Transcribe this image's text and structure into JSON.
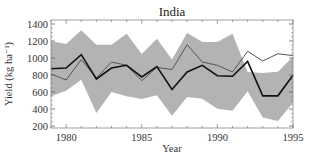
{
  "chart_data": {
    "type": "line",
    "title": "India",
    "xlabel": "Year",
    "ylabel": "Yield (kg ha⁻¹)",
    "xlim": [
      1979,
      1995
    ],
    "ylim": [
      150,
      1450
    ],
    "x_ticks": [
      1980,
      1985,
      1990,
      1995
    ],
    "y_ticks": [
      200,
      400,
      600,
      800,
      1000,
      1200,
      1400
    ],
    "grid": false,
    "legend": null,
    "x": [
      1979,
      1980,
      1981,
      1982,
      1983,
      1984,
      1985,
      1986,
      1987,
      1988,
      1989,
      1990,
      1991,
      1992,
      1993,
      1994,
      1995
    ],
    "series": [
      {
        "name": "observed",
        "style": "thick-black-line",
        "color": "#111111",
        "values": [
          874,
          882,
          1039,
          753,
          882,
          914,
          777,
          898,
          630,
          835,
          914,
          792,
          785,
          961,
          555,
          555,
          798
        ]
      },
      {
        "name": "simulated",
        "style": "thin-dark-gray-line",
        "color": "#555555",
        "values": [
          812,
          741,
          981,
          765,
          953,
          914,
          733,
          890,
          863,
          1157,
          953,
          914,
          835,
          1079,
          965,
          1050,
          1028
        ]
      }
    ],
    "band": {
      "name": "range",
      "color": "#b3b3b3",
      "upper": [
        1196,
        1165,
        1326,
        1157,
        1157,
        1286,
        1047,
        1227,
        981,
        1294,
        1188,
        1188,
        1286,
        835,
        825,
        839,
        1016
      ],
      "lower": [
        549,
        616,
        745,
        353,
        600,
        549,
        518,
        561,
        320,
        541,
        522,
        404,
        380,
        608,
        300,
        260,
        475
      ]
    }
  }
}
